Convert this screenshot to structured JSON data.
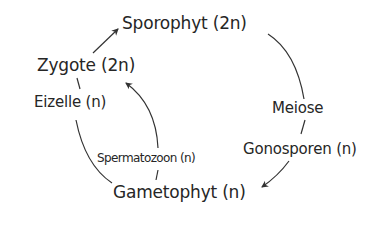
{
  "diagram": {
    "type": "life-cycle",
    "nodes": {
      "sporophyt": "Sporophyt (2n)",
      "meiose": "Meiose",
      "gonosporen": "Gonosporen (n)",
      "gametophyt": "Gametophyt (n)",
      "spermatozoon": "Spermatozoon (n)",
      "eizelle": "Eizelle (n)",
      "zygote": "Zygote (2n)"
    },
    "edges": [
      {
        "from": "Sporophyt (2n)",
        "to": "Meiose"
      },
      {
        "from": "Meiose",
        "to": "Gonosporen (n)"
      },
      {
        "from": "Gonosporen (n)",
        "to": "Gametophyt (n)"
      },
      {
        "from": "Gametophyt (n)",
        "to": "Eizelle (n)"
      },
      {
        "from": "Gametophyt (n)",
        "to": "Spermatozoon (n)"
      },
      {
        "from": "Eizelle (n)",
        "to": "Zygote (2n)"
      },
      {
        "from": "Spermatozoon (n)",
        "to": "Zygote (2n)"
      },
      {
        "from": "Zygote (2n)",
        "to": "Sporophyt (2n)"
      }
    ],
    "colors": {
      "text": "#262626",
      "line": "#333333",
      "background": "#ffffff"
    }
  }
}
